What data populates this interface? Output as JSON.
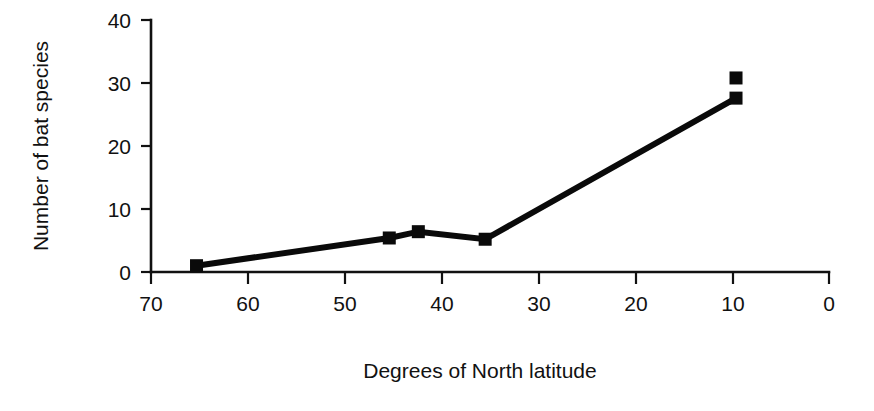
{
  "chart_data": {
    "type": "line",
    "title": "",
    "xlabel": "Degrees of North latitude",
    "ylabel": "Number of bat species",
    "xlim": [
      70,
      0
    ],
    "ylim": [
      0,
      40
    ],
    "x_reversed": true,
    "grid": false,
    "legend": "none",
    "xticks": [
      70,
      60,
      50,
      40,
      30,
      20,
      10,
      0
    ],
    "xtick_labels": [
      "70",
      "60",
      "50",
      "40",
      "30",
      "20",
      "10",
      "0"
    ],
    "yticks": [
      0,
      10,
      20,
      30,
      40
    ],
    "ytick_labels": [
      "0",
      "10",
      "20",
      "30",
      "40"
    ],
    "marker": "square",
    "series": [
      {
        "name": "Bat species vs latitude",
        "x": [
          65.3,
          45.4,
          42.4,
          35.5,
          9.6
        ],
        "y": [
          1.0,
          5.4,
          6.4,
          5.2,
          27.6
        ],
        "connected": true
      },
      {
        "name": "Unconnected point",
        "x": [
          9.6
        ],
        "y": [
          30.8
        ],
        "connected": false
      }
    ],
    "colors": {
      "line": "#0a0a0a",
      "marker": "#0a0a0a",
      "axis": "#111111",
      "background": "#ffffff"
    }
  }
}
